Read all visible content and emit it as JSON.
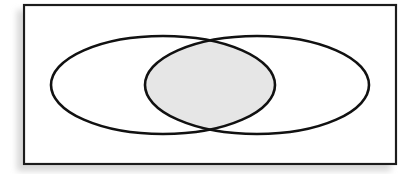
{
  "figure": {
    "kind": "venn-diagram",
    "caption": "",
    "title": "",
    "background_color": "#ffffff"
  },
  "canvas": {
    "width": 418,
    "height": 174
  },
  "universal_set_rectangle": {
    "label": "",
    "x": 24,
    "y": 5,
    "width": 372,
    "height": 159,
    "fill_color": "#ffffff",
    "stroke_color": "#1a1a1a",
    "stroke_width": 2.2
  },
  "shadow": {
    "color": "#d6d6d6",
    "offset_x": -6,
    "offset_y": 6,
    "blur": 6
  },
  "sets": [
    {
      "name": "left-set",
      "label": "",
      "center_x": 163,
      "center_y": 85,
      "radius_x": 112,
      "radius_y": 49,
      "fill_color": "none",
      "stroke_color": "#111111",
      "stroke_width": 2.6
    },
    {
      "name": "right-set",
      "label": "",
      "center_x": 257,
      "center_y": 85,
      "radius_x": 112,
      "radius_y": 49,
      "fill_color": "none",
      "stroke_color": "#111111",
      "stroke_width": 2.6
    }
  ],
  "intersection": {
    "name": "intersection-region",
    "label": "",
    "shaded": true,
    "fill_color": "#e6e6e6",
    "stroke_color": "#111111",
    "stroke_width": 2.6,
    "top_crossing_x": 209,
    "top_crossing_y": 40,
    "bottom_crossing_x": 209,
    "bottom_crossing_y": 129
  }
}
